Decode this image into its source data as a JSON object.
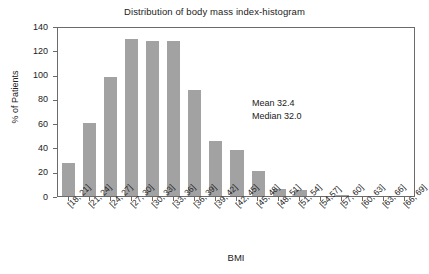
{
  "chart_data": {
    "type": "bar",
    "title": "Distribution of body mass index-histogram",
    "xlabel": "BMI",
    "ylabel": "% of Patients",
    "categories": [
      "[18, 21]",
      "[21, 24]",
      "[24, 27]",
      "[27, 30]",
      "[30, 33]",
      "[33, 36]",
      "[36, 39]",
      "[39, 42]",
      "[42, 45]",
      "[45, 48]",
      "[48, 51]",
      "[51, 54]",
      "[54,57]",
      "[57, 60]",
      "[60, 63]",
      "[63, 66]",
      "[66, 69]"
    ],
    "values": [
      27,
      60,
      98,
      129,
      128,
      128,
      87,
      45,
      38,
      21,
      6,
      5,
      0,
      1,
      0,
      0,
      0
    ],
    "ylim": [
      0,
      140
    ],
    "yticks": [
      0,
      20,
      40,
      60,
      80,
      100,
      120,
      140
    ],
    "grid": false,
    "legend": false,
    "bar_color": "#a2a2a2",
    "axis_color": "#6b6b6b",
    "annotations": [
      {
        "label": "Mean 32.4"
      },
      {
        "label": "Median 32.0"
      }
    ]
  }
}
